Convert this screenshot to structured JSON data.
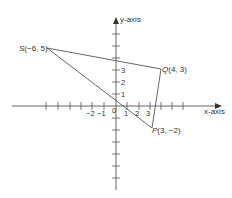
{
  "axes": {
    "x_label": "x-axis",
    "y_label": "y-axis",
    "x_tick_labels": [
      {
        "value": -2,
        "text": "−2"
      },
      {
        "value": -1,
        "text": "−1"
      },
      {
        "value": 0,
        "text": "0"
      },
      {
        "value": 1,
        "text": "1"
      },
      {
        "value": 2,
        "text": "2"
      },
      {
        "value": 3,
        "text": "3"
      }
    ],
    "y_tick_labels": [
      {
        "value": 1,
        "text": "1"
      },
      {
        "value": 2,
        "text": "2"
      },
      {
        "value": 3,
        "text": "3"
      }
    ]
  },
  "points": {
    "S": {
      "name": "S",
      "coords": "(−6, 5)",
      "x": -6,
      "y": 5
    },
    "Q": {
      "name": "Q",
      "coords": "(4, 3)",
      "x": 4,
      "y": 3
    },
    "P": {
      "name": "P",
      "coords": "(3, −2)",
      "x": 3,
      "y": -2
    }
  },
  "shape": "triangle SQP",
  "colors": {
    "line": "#555555",
    "text": "#333333"
  }
}
